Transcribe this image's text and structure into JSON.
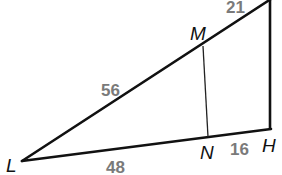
{
  "diagram": {
    "type": "triangle-with-segment",
    "colors": {
      "line": "#111111",
      "measure": "#7a7a7a",
      "background": "#ffffff"
    },
    "vertices": {
      "L": {
        "label": "L",
        "x": 22,
        "y": 161
      },
      "H": {
        "label": "H",
        "x": 270,
        "y": 129
      },
      "T": {
        "label": "",
        "x": 270,
        "y": 0
      },
      "M": {
        "label": "M",
        "x": 203,
        "y": 46
      },
      "N": {
        "label": "N",
        "x": 208,
        "y": 137
      }
    },
    "measures": {
      "LM": "56",
      "MT": "21",
      "LN": "48",
      "NH": "16"
    }
  }
}
